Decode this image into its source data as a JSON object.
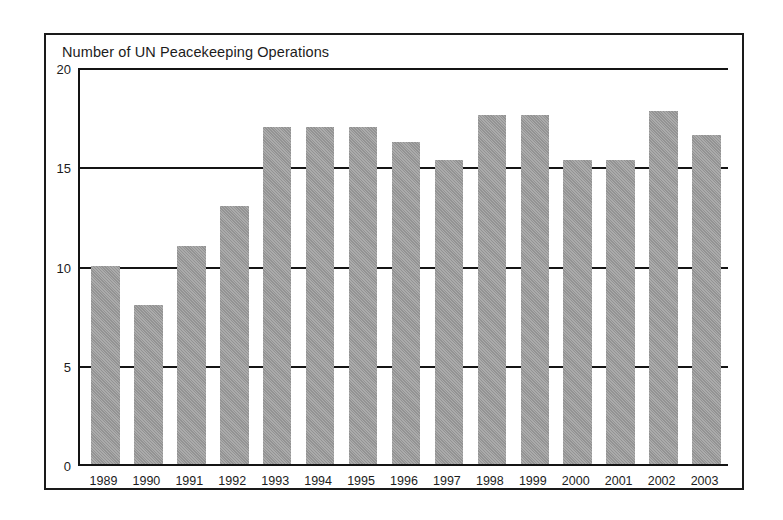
{
  "figure": {
    "title": "Number of UN Peacekeeping Operations",
    "frame_color": "#1a1a1a",
    "bar_color": "#9b9b9b",
    "axis_color": "#141414",
    "background": "#ffffff"
  },
  "chart_data": {
    "type": "bar",
    "title": "Number of UN Peacekeeping Operations",
    "xlabel": "",
    "ylabel": "",
    "ylim": [
      0,
      20
    ],
    "yticks": [
      0,
      5,
      10,
      15,
      20
    ],
    "ytick_labels": [
      "0",
      "5",
      "10",
      "15",
      "20"
    ],
    "grid": true,
    "grid_axis": "y",
    "legend": false,
    "categories": [
      "1989",
      "1990",
      "1991",
      "1992",
      "1993",
      "1994",
      "1995",
      "1996",
      "1997",
      "1998",
      "1999",
      "2000",
      "2001",
      "2002",
      "2003"
    ],
    "values": [
      10,
      8,
      11,
      13,
      17,
      17,
      17,
      16.2,
      15.3,
      17.6,
      17.6,
      15.3,
      15.3,
      17.8,
      16.6
    ]
  }
}
